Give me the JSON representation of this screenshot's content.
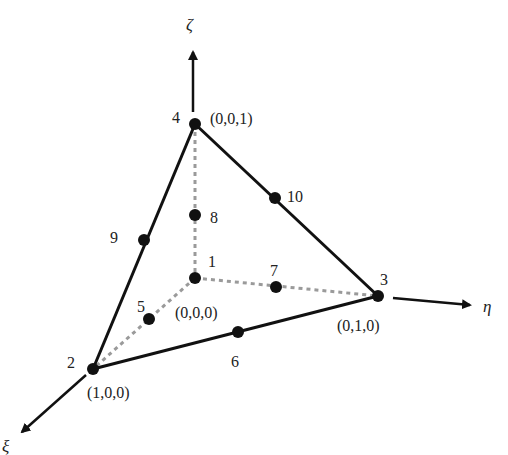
{
  "diagram": {
    "type": "tetrahedral-element",
    "axes": [
      {
        "name": "zeta",
        "symbol": "ζ"
      },
      {
        "name": "eta",
        "symbol": "η"
      },
      {
        "name": "xi",
        "symbol": "ξ"
      }
    ],
    "nodes": [
      {
        "id": "1",
        "coords": "(0,0,0)"
      },
      {
        "id": "2",
        "coords": "(1,0,0)"
      },
      {
        "id": "3",
        "coords": "(0,1,0)"
      },
      {
        "id": "4",
        "coords": "(0,0,1)"
      },
      {
        "id": "5",
        "coords": ""
      },
      {
        "id": "6",
        "coords": ""
      },
      {
        "id": "7",
        "coords": ""
      },
      {
        "id": "8",
        "coords": ""
      },
      {
        "id": "9",
        "coords": ""
      },
      {
        "id": "10",
        "coords": ""
      }
    ],
    "colors": {
      "line": "#111111",
      "dashed": "#9a9a9a",
      "node": "#111111"
    }
  }
}
